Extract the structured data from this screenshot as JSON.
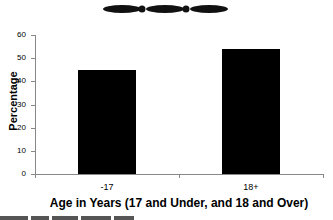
{
  "chart_data": {
    "type": "bar",
    "title": "",
    "categories": [
      "-17",
      "18+"
    ],
    "values": [
      45,
      54
    ],
    "xlabel": "Age in Years (17 and Under, and 18 and Over)",
    "ylabel": "Percentage",
    "ylim": [
      0,
      60
    ],
    "yticks": [
      0,
      10,
      20,
      30,
      40,
      50,
      60
    ],
    "grid": false,
    "legend": null,
    "bar_color": "#000000"
  },
  "ytick_labels": [
    "0",
    "10",
    "20",
    "30",
    "40",
    "50",
    "60"
  ],
  "colors": {
    "bar": "#000000",
    "axis": "#888888",
    "background": "#ffffff"
  }
}
